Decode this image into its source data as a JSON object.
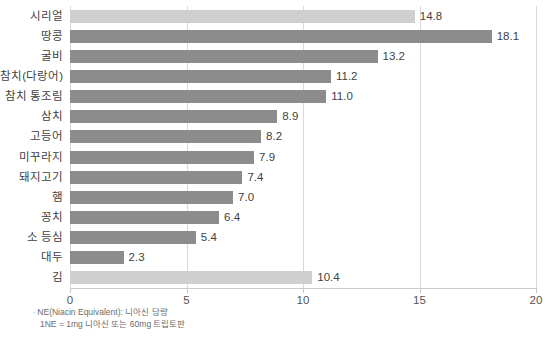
{
  "chart_data": {
    "type": "bar",
    "orientation": "horizontal",
    "title": "",
    "subtitle": "",
    "xlabel": "",
    "ylabel": "",
    "xlim": [
      0,
      20
    ],
    "xticks": [
      "0",
      "5",
      "10",
      "15",
      "20"
    ],
    "xtick_values": [
      0,
      5,
      10,
      15,
      20
    ],
    "grid": true,
    "grid_axis": "x",
    "legend": "none",
    "categories": [
      "시리얼",
      "땅콩",
      "굴비",
      "참치(다랑어)",
      "참치 통조림",
      "삼치",
      "고등어",
      "미꾸라지",
      "돼지고기",
      "햄",
      "꽁치",
      "소 등심",
      "대두",
      "김"
    ],
    "values": [
      14.8,
      18.1,
      13.2,
      11.2,
      11.0,
      8.9,
      8.2,
      7.9,
      7.4,
      7.0,
      6.4,
      5.4,
      2.3,
      10.4
    ],
    "value_labels": [
      "14.8",
      "18.1",
      "13.2",
      "11.2",
      "11.0",
      "8.9",
      "8.2",
      "7.9",
      "7.4",
      "7.0",
      "6.4",
      "5.4",
      "2.3",
      "10.4"
    ],
    "highlighted": [
      true,
      false,
      false,
      false,
      false,
      false,
      false,
      false,
      false,
      false,
      false,
      false,
      false,
      true
    ],
    "colors": {
      "bar": "#8c8c8c",
      "bar_highlight": "#cfcfcf",
      "gridline": "#d9d9d9",
      "axis": "#c8c8c8",
      "text": "#3f3f3f"
    }
  },
  "footnotes": {
    "bullet": "·",
    "line1": "NE(Niacin Equivalent): 니아신 당량",
    "line2": "1NE = 1mg 니아신 또는 60mg 트립토판"
  }
}
